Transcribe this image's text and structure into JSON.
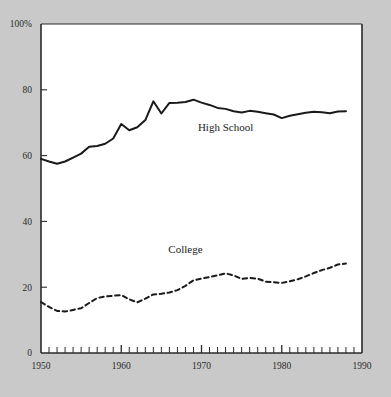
{
  "chart_data": {
    "type": "line",
    "title": "",
    "subtitle": "",
    "xlabel": "",
    "ylabel": "",
    "xlim": [
      1950,
      1990
    ],
    "ylim": [
      0,
      100
    ],
    "grid": false,
    "legend_position": "inline-annotations",
    "background_color": "#c9c9c9",
    "plot_background_color": "#ffffff",
    "axis_color": "#2b2b2b",
    "y_ticks": [
      {
        "value": 100,
        "label": "100%"
      },
      {
        "value": 80,
        "label": "80"
      },
      {
        "value": 60,
        "label": "60"
      },
      {
        "value": 40,
        "label": "40"
      },
      {
        "value": 20,
        "label": "20"
      },
      {
        "value": 0,
        "label": "0"
      }
    ],
    "x_ticks": [
      {
        "value": 1950,
        "label": "1950"
      },
      {
        "value": 1960,
        "label": "1960"
      },
      {
        "value": 1970,
        "label": "1970"
      },
      {
        "value": 1980,
        "label": "1980"
      },
      {
        "value": 1990,
        "label": "1990"
      }
    ],
    "x_minor_tick_interval": 1,
    "x": [
      1950,
      1951,
      1952,
      1953,
      1954,
      1955,
      1956,
      1957,
      1958,
      1959,
      1960,
      1961,
      1962,
      1963,
      1964,
      1965,
      1966,
      1967,
      1968,
      1969,
      1970,
      1971,
      1972,
      1973,
      1974,
      1975,
      1976,
      1977,
      1978,
      1979,
      1980,
      1981,
      1982,
      1983,
      1984,
      1985,
      1986,
      1987,
      1988
    ],
    "series": [
      {
        "name": "High School",
        "label": "High School",
        "color": "#1a1a1a",
        "style": "solid",
        "width": 2.0,
        "label_x": 1973,
        "label_y": 67.5,
        "values": [
          59.0,
          58.2,
          57.5,
          58.2,
          59.4,
          60.6,
          62.7,
          62.9,
          63.6,
          65.2,
          69.6,
          67.7,
          68.6,
          70.8,
          76.5,
          72.8,
          76.0,
          76.1,
          76.3,
          77.0,
          76.1,
          75.4,
          74.5,
          74.2,
          73.5,
          73.1,
          73.6,
          73.3,
          72.9,
          72.5,
          71.4,
          72.1,
          72.6,
          73.0,
          73.3,
          73.2,
          72.9,
          73.4,
          73.5
        ]
      },
      {
        "name": "College",
        "label": "College",
        "color": "#1a1a1a",
        "style": "dashed",
        "width": 2.0,
        "label_x": 1968,
        "label_y": 30.5,
        "values": [
          15.5,
          14.0,
          12.8,
          12.6,
          13.1,
          13.6,
          15.2,
          16.7,
          17.2,
          17.4,
          17.6,
          16.3,
          15.4,
          16.5,
          17.8,
          18.0,
          18.4,
          19.1,
          20.4,
          22.1,
          22.6,
          23.1,
          23.6,
          24.2,
          23.6,
          22.5,
          22.8,
          22.6,
          21.7,
          21.5,
          21.3,
          21.8,
          22.4,
          23.3,
          24.3,
          25.2,
          25.9,
          26.9,
          27.2
        ]
      }
    ]
  },
  "axes_geometry": {
    "plot_left_px": 41,
    "plot_right_px": 362,
    "plot_top_px": 24,
    "plot_bottom_px": 353
  }
}
